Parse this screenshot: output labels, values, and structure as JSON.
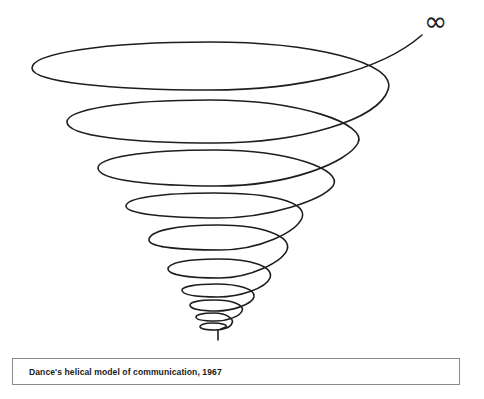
{
  "figure": {
    "title": "Dance's helical model of communication, 1967",
    "symbol": "∞",
    "symbol_meaning": "infinity-endpoint",
    "stroke_color": "#1e1e1e",
    "background_color": "#ffffff",
    "loops": [
      {
        "index": 1,
        "left_x": 200,
        "right_x": 228,
        "top_y": 323,
        "bottom_y": 330
      },
      {
        "index": 2,
        "left_x": 196,
        "right_x": 233,
        "top_y": 313,
        "bottom_y": 321
      },
      {
        "index": 3,
        "left_x": 190,
        "right_x": 243,
        "top_y": 300,
        "bottom_y": 311
      },
      {
        "index": 4,
        "left_x": 182,
        "right_x": 254,
        "top_y": 284,
        "bottom_y": 297
      },
      {
        "index": 5,
        "left_x": 168,
        "right_x": 270,
        "top_y": 259,
        "bottom_y": 278
      },
      {
        "index": 6,
        "left_x": 149,
        "right_x": 287,
        "top_y": 225,
        "bottom_y": 250
      },
      {
        "index": 7,
        "left_x": 126,
        "right_x": 302,
        "top_y": 193,
        "bottom_y": 218
      },
      {
        "index": 8,
        "left_x": 98,
        "right_x": 333,
        "top_y": 150,
        "bottom_y": 186
      },
      {
        "index": 9,
        "left_x": 67,
        "right_x": 358,
        "top_y": 100,
        "bottom_y": 143
      },
      {
        "index": 10,
        "left_x": 32,
        "right_x": 388,
        "top_y": 42,
        "bottom_y": 90
      }
    ]
  },
  "caption": {
    "text": "Dance's helical model of communication, 1967"
  }
}
